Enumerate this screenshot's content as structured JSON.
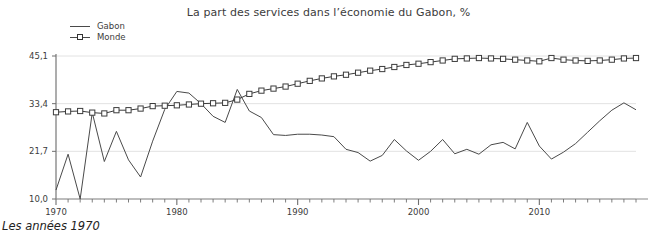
{
  "chart_data": {
    "type": "line",
    "title": "La part des services dans l’économie du Gabon, %",
    "xlabel": "",
    "ylabel": "",
    "caption": "Les années 1970",
    "grid": true,
    "legend_position": "top-left",
    "xlim": [
      1970,
      2018
    ],
    "ylim": [
      10.0,
      45.1
    ],
    "ytick_labels": [
      "45,1",
      "33,4",
      "21,7",
      "10,0"
    ],
    "ytick_values": [
      45.1,
      33.4,
      21.7,
      10.0
    ],
    "xtick_labels": [
      "1970",
      "1980",
      "1990",
      "2000",
      "2010"
    ],
    "xtick_values": [
      1970,
      1980,
      1990,
      2000,
      2010
    ],
    "x": [
      1970,
      1971,
      1972,
      1973,
      1974,
      1975,
      1976,
      1977,
      1978,
      1979,
      1980,
      1981,
      1982,
      1983,
      1984,
      1985,
      1986,
      1987,
      1988,
      1989,
      1990,
      1991,
      1992,
      1993,
      1994,
      1995,
      1996,
      1997,
      1998,
      1999,
      2000,
      2001,
      2002,
      2003,
      2004,
      2005,
      2006,
      2007,
      2008,
      2009,
      2010,
      2011,
      2012,
      2013,
      2014,
      2015,
      2016,
      2017,
      2018
    ],
    "series": [
      {
        "name": "Gabon",
        "marker": "none",
        "color": "#4a4a4a",
        "values": [
          12.2,
          21.0,
          10.0,
          31.2,
          19.2,
          26.6,
          19.6,
          15.4,
          24.2,
          32.0,
          36.4,
          36.0,
          33.4,
          30.3,
          28.8,
          36.9,
          31.6,
          30.0,
          25.8,
          25.6,
          25.9,
          25.9,
          25.7,
          25.3,
          22.2,
          21.4,
          19.3,
          20.7,
          24.6,
          21.8,
          19.5,
          21.7,
          24.6,
          21.1,
          22.2,
          21.0,
          23.3,
          23.9,
          22.3,
          28.8,
          23.0,
          19.8,
          21.5,
          23.6,
          26.4,
          29.2,
          31.8,
          33.6,
          31.9
        ]
      },
      {
        "name": "Monde",
        "marker": "square",
        "color": "#3c3c3c",
        "values": [
          31.3,
          31.5,
          31.6,
          31.2,
          31.0,
          31.8,
          31.8,
          32.2,
          32.8,
          32.9,
          33.0,
          33.2,
          33.4,
          33.5,
          33.6,
          34.4,
          35.8,
          36.6,
          37.1,
          37.6,
          38.3,
          39.0,
          39.6,
          40.1,
          40.5,
          41.0,
          41.5,
          41.9,
          42.4,
          42.9,
          43.2,
          43.6,
          44.0,
          44.4,
          44.5,
          44.6,
          44.5,
          44.4,
          44.2,
          44.0,
          43.8,
          44.6,
          44.2,
          44.0,
          43.9,
          44.0,
          44.2,
          44.5,
          44.6
        ]
      }
    ]
  },
  "legend": {
    "items": [
      {
        "label": "Gabon"
      },
      {
        "label": "Monde"
      }
    ]
  }
}
